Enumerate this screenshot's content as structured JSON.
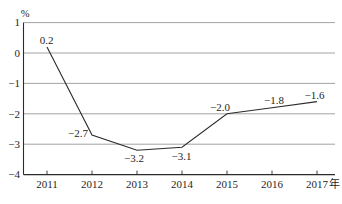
{
  "chart_data": {
    "type": "line",
    "title": "",
    "unit_label": "%",
    "x_suffix": "年",
    "categories": [
      "2011",
      "2012",
      "2013",
      "2014",
      "2015",
      "2016",
      "2017"
    ],
    "values": [
      0.2,
      -2.7,
      -3.2,
      -3.1,
      -2.0,
      -1.8,
      -1.6
    ],
    "labels": [
      "0.2",
      "−2.7",
      "−3.2",
      "−3.1",
      "−2.0",
      "−1.8",
      "−1.6"
    ],
    "ylim": [
      -4,
      1
    ],
    "yticks": [
      1,
      0,
      -1,
      -2,
      -3,
      -4
    ],
    "ytick_labels": [
      "1",
      "0",
      "−1",
      "−2",
      "−3",
      "−4"
    ],
    "grid": true,
    "legend": "none",
    "line_color": "#2b2b2b",
    "axis_color": "#2b2b2b",
    "grid_color": "#8a8a8a",
    "text_color": "#1f1f1f",
    "background": "#ffffff"
  }
}
